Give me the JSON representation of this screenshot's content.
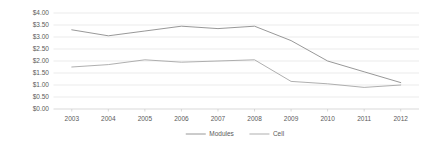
{
  "chart_data": {
    "type": "line",
    "title": "",
    "subtitle": "",
    "xlabel": "",
    "ylabel": "",
    "categories": [
      "2003",
      "2004",
      "2005",
      "2006",
      "2007",
      "2008",
      "2009",
      "2010",
      "2011",
      "2012"
    ],
    "series": [
      {
        "name": "Modules",
        "color": "#8c8c8c",
        "values": [
          3.3,
          3.05,
          3.25,
          3.45,
          3.35,
          3.45,
          2.85,
          2.0,
          1.55,
          1.1
        ]
      },
      {
        "name": "Cell",
        "color": "#a6a6a6",
        "values": [
          1.75,
          1.85,
          2.05,
          1.95,
          2.0,
          2.05,
          1.15,
          1.05,
          0.9,
          1.0
        ]
      }
    ],
    "ylim": [
      0.0,
      4.0
    ],
    "ytick_values": [
      0.0,
      0.5,
      1.0,
      1.5,
      2.0,
      2.5,
      3.0,
      3.5,
      4.0
    ],
    "ytick_labels": [
      "$0.00",
      "$0.50",
      "$1.00",
      "$1.50",
      "$2.00",
      "$2.50",
      "$3.00",
      "$3.50",
      "$4.00"
    ],
    "grid": true,
    "grid_color": "#e3e3e3",
    "legend_position": "bottom",
    "legend_entries": [
      "Modules",
      "Cell"
    ],
    "background_color": "#ffffff",
    "axis_color": "#c9c9c9",
    "tick_label_color": "#5a5a5a"
  }
}
